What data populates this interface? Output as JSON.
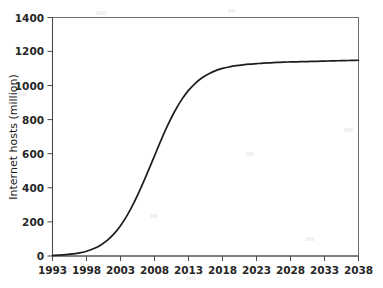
{
  "chart_data": {
    "type": "line",
    "title": "",
    "xlabel": "",
    "ylabel": "Internet hosts (million)",
    "xlim": [
      1993,
      2038
    ],
    "ylim": [
      0,
      1400
    ],
    "grid": false,
    "legend": false,
    "x_ticks": [
      1993,
      1998,
      2003,
      2008,
      2013,
      2018,
      2023,
      2028,
      2033,
      2038
    ],
    "y_ticks": [
      0,
      200,
      400,
      600,
      800,
      1000,
      1200,
      1400
    ],
    "series": [
      {
        "name": "Internet hosts",
        "color": "#1c1c1c",
        "x": [
          1993,
          1994,
          1995,
          1996,
          1997,
          1998,
          1999,
          2000,
          2001,
          2002,
          2003,
          2004,
          2005,
          2006,
          2007,
          2008,
          2009,
          2010,
          2011,
          2012,
          2013,
          2014,
          2015,
          2016,
          2017,
          2018,
          2019,
          2020,
          2021,
          2022,
          2023,
          2024,
          2025,
          2026,
          2027,
          2028,
          2029,
          2030,
          2031,
          2032,
          2033,
          2034,
          2035,
          2036,
          2037,
          2038
        ],
        "y": [
          3,
          5,
          8,
          12,
          18,
          28,
          42,
          62,
          90,
          128,
          178,
          240,
          315,
          400,
          492,
          588,
          683,
          772,
          851,
          918,
          972,
          1014,
          1046,
          1070,
          1088,
          1101,
          1110,
          1117,
          1122,
          1126,
          1129,
          1132,
          1134,
          1136,
          1138,
          1139,
          1140,
          1141,
          1142,
          1143,
          1144,
          1145,
          1146,
          1147,
          1148,
          1149
        ]
      }
    ],
    "plateau_value": 1150,
    "inflection_year": 2011,
    "x_tick_labels": [
      "1993",
      "1998",
      "2003",
      "2008",
      "2013",
      "2018",
      "2023",
      "2028",
      "2033",
      "2038"
    ],
    "y_tick_labels": [
      "0",
      "200",
      "400",
      "600",
      "800",
      "1000",
      "1200",
      "1400"
    ]
  },
  "axes": {
    "y_title": "Internet hosts (million)"
  }
}
